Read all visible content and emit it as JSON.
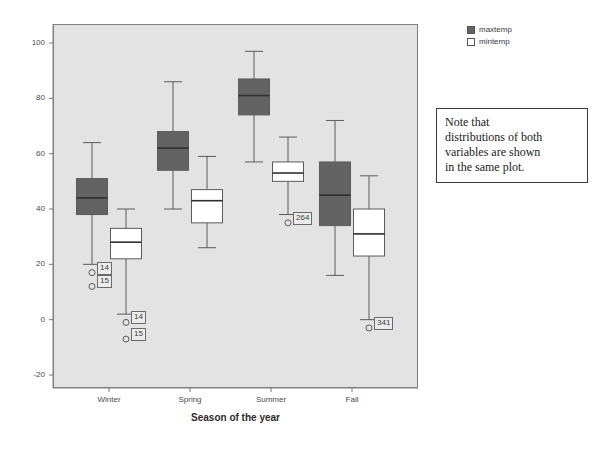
{
  "chart_data": {
    "type": "box",
    "title": "",
    "xlabel": "Season of the year",
    "ylabel": "",
    "categories": [
      "Winter",
      "Spring",
      "Summer",
      "Fall"
    ],
    "ylim": [
      -20,
      100
    ],
    "ytick_labels": [
      "100",
      "80",
      "60",
      "40",
      "20",
      "0",
      "-20"
    ],
    "ytick_values": [
      100,
      80,
      60,
      40,
      20,
      0,
      -20
    ],
    "grid": false,
    "legend_position": "top-right",
    "series": [
      {
        "name": "maxtemp",
        "color": "#636363",
        "boxes": [
          {
            "category": "Winter",
            "whisker_high": 64,
            "q3": 51,
            "median": 44,
            "q1": 38,
            "whisker_low": 20,
            "outliers": [
              {
                "value": 17,
                "label": "14"
              },
              {
                "value": 12,
                "label": "15"
              }
            ]
          },
          {
            "category": "Spring",
            "whisker_high": 86,
            "q3": 68,
            "median": 62,
            "q1": 54,
            "whisker_low": 40,
            "outliers": []
          },
          {
            "category": "Summer",
            "whisker_high": 97,
            "q3": 87,
            "median": 81,
            "q1": 74,
            "whisker_low": 57,
            "outliers": []
          },
          {
            "category": "Fall",
            "whisker_high": 72,
            "q3": 57,
            "median": 45,
            "q1": 34,
            "whisker_low": 16,
            "outliers": []
          }
        ]
      },
      {
        "name": "mintemp",
        "color": "#ffffff",
        "boxes": [
          {
            "category": "Winter",
            "whisker_high": 40,
            "q3": 33,
            "median": 28,
            "q1": 22,
            "whisker_low": 2,
            "outliers": [
              {
                "value": -1,
                "label": "14"
              },
              {
                "value": -7,
                "label": "15"
              }
            ]
          },
          {
            "category": "Spring",
            "whisker_high": 59,
            "q3": 47,
            "median": 43,
            "q1": 35,
            "whisker_low": 26,
            "outliers": []
          },
          {
            "category": "Summer",
            "whisker_high": 66,
            "q3": 57,
            "median": 53,
            "q1": 50,
            "whisker_low": 38,
            "outliers": [
              {
                "value": 35,
                "label": "264"
              }
            ]
          },
          {
            "category": "Fall",
            "whisker_high": 52,
            "q3": 40,
            "median": 31,
            "q1": 23,
            "whisker_low": 0,
            "outliers": [
              {
                "value": -3,
                "label": "341"
              }
            ]
          }
        ]
      }
    ]
  },
  "legend": {
    "items": [
      {
        "label": "maxtemp",
        "color": "#636363"
      },
      {
        "label": "mintemp",
        "color": "#ffffff"
      }
    ]
  },
  "annotation": {
    "lines": [
      "Note that",
      "distributions of both",
      "variables are shown",
      "in the same plot."
    ]
  },
  "axes": {
    "x_title": "Season of the year",
    "y_ticks": [
      "100",
      "80",
      "60",
      "40",
      "20",
      "0",
      "-20"
    ],
    "x_ticks": [
      "Winter",
      "Spring",
      "Summer",
      "Fall"
    ]
  },
  "colors": {
    "plot_background": "#e3e3e3",
    "page_background": "#ffffff",
    "maxtemp": "#636363",
    "mintemp": "#ffffff",
    "line": "#5a5a5a",
    "frame": "#808080"
  }
}
